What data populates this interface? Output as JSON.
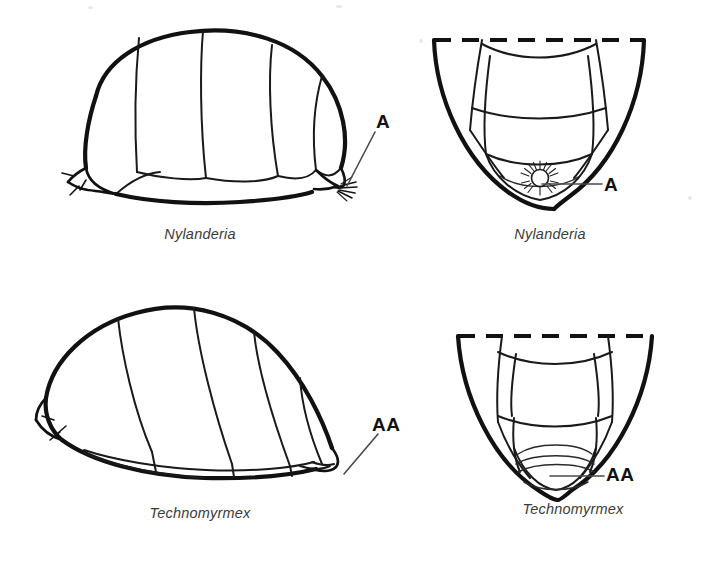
{
  "figure": {
    "type": "scientific-illustration-plate",
    "background_color": "#ffffff",
    "ink_color": "#111111",
    "caption_color": "#3b3b3b",
    "layout": "2x2 grid: rows = genus, columns = lateral view then ventral/posterior view"
  },
  "panels": [
    {
      "id": "nylanderia-lateral",
      "caption": "Nylanderia",
      "view": "lateral",
      "row": 1,
      "column": 1,
      "pointer": {
        "label": "A",
        "meaning": "acidopore",
        "target": "gaster apex, circular acidopore fringed with hairs"
      },
      "features": [
        "six visible gastral segments",
        "hair fringe at apex",
        "small spurs at anteroventral base"
      ]
    },
    {
      "id": "nylanderia-ventral",
      "caption": "Nylanderia",
      "view": "ventral-posterior",
      "row": 1,
      "column": 2,
      "pointer": {
        "label": "A",
        "meaning": "acidopore",
        "target": "circular acidopore with radiating setae"
      },
      "features": [
        "dashed line marks cut edge at top",
        "rounded U-shaped outline",
        "circular acidopore with sunburst of hairs at apex"
      ]
    },
    {
      "id": "technomyrmex-lateral",
      "caption": "Technomyrmex",
      "view": "lateral",
      "row": 2,
      "column": 1,
      "pointer": {
        "label": "AA",
        "meaning": "anal aperture",
        "target": "gaster apex, transverse slit-like anal aperture"
      },
      "features": [
        "gaster tilted, apex pointing down-right",
        "no hair fringe at apex",
        "spurs at anteroventral base"
      ]
    },
    {
      "id": "technomyrmex-ventral",
      "caption": "Technomyrmex",
      "view": "ventral-posterior",
      "row": 2,
      "column": 2,
      "pointer": {
        "label": "AA",
        "meaning": "anal aperture",
        "target": "transverse slit-like anal aperture"
      },
      "features": [
        "dashed line marks cut edge at top",
        "narrow V-shaped outline",
        "transverse slit, no circular acidopore"
      ]
    }
  ],
  "labels": {
    "acidopore": "A",
    "anal_aperture": "AA"
  },
  "captions": {
    "nylanderia": "Nylanderia",
    "technomyrmex": "Technomyrmex"
  }
}
